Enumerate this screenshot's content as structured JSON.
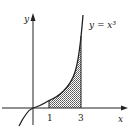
{
  "figure": {
    "curve_label": "y = x³",
    "x_axis_label": "x",
    "y_axis_label": "y",
    "ticks": [
      {
        "value": "1"
      },
      {
        "value": "3"
      }
    ],
    "shaded_region": "area under y = x³ from x = 1 to x = 3",
    "colors": {
      "ink": "#222222",
      "shade": "#9a9a9a",
      "background": "#ffffff"
    }
  }
}
